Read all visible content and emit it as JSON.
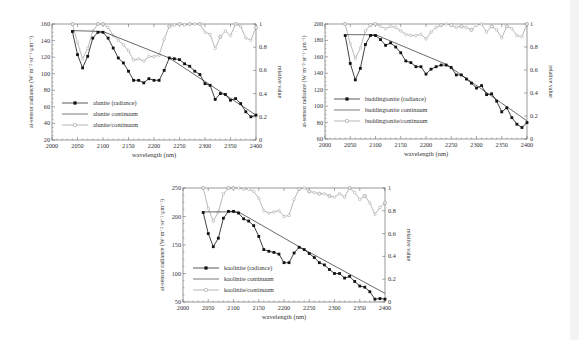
{
  "chart_data": [
    {
      "id": "alunite",
      "type": "line",
      "xlabel": "wavelength (nm)",
      "ylabel": "at-sensor radiance (W·m⁻²·sr⁻¹·μm⁻¹)",
      "ylabel_right": "relative value",
      "xlim": [
        2000,
        2400
      ],
      "ylim": [
        20,
        160
      ],
      "ylim_right": [
        0,
        1
      ],
      "xticks": [
        2000,
        2050,
        2100,
        2150,
        2200,
        2250,
        2300,
        2350,
        2400
      ],
      "yticks": [
        20,
        40,
        60,
        80,
        100,
        120,
        140,
        160
      ],
      "yticks_right": [
        0,
        0.2,
        0.4,
        0.6,
        0.8,
        1
      ],
      "grid": false,
      "legend_position": "lower-left",
      "frame": {
        "x0": 52,
        "x1": 256,
        "y0": 24,
        "y1": 140
      },
      "legend": {
        "x": 62,
        "y": 103,
        "dy": 11
      },
      "x": [
        2040,
        2050,
        2060,
        2070,
        2080,
        2090,
        2100,
        2110,
        2120,
        2130,
        2140,
        2150,
        2160,
        2170,
        2180,
        2190,
        2200,
        2210,
        2220,
        2230,
        2240,
        2250,
        2260,
        2270,
        2280,
        2290,
        2300,
        2310,
        2320,
        2330,
        2340,
        2350,
        2360,
        2370,
        2380,
        2390,
        2400
      ],
      "series": [
        {
          "name": "alunite (radiance)",
          "axis": "left",
          "style": "filled-square",
          "values": [
            151,
            123,
            107,
            121,
            143,
            150,
            150,
            143,
            131,
            119,
            113,
            103,
            92,
            92,
            89,
            94,
            92,
            92,
            104,
            119,
            118,
            117,
            112,
            109,
            103,
            99,
            88,
            86,
            69,
            76,
            75,
            68,
            70,
            64,
            54,
            48,
            50
          ]
        },
        {
          "name": "alunite continuum",
          "axis": "left",
          "style": "line",
          "points": [
            [
              2040,
              152
            ],
            [
              2100,
              151
            ],
            [
              2230,
              119
            ],
            [
              2400,
              50
            ]
          ]
        },
        {
          "name": "alunite/continuum",
          "axis": "right",
          "style": "open-circle",
          "values": [
            1.0,
            0.84,
            0.7,
            0.79,
            0.94,
            1.0,
            1.0,
            0.97,
            0.9,
            0.86,
            0.82,
            0.77,
            0.69,
            0.7,
            0.68,
            0.72,
            0.72,
            0.73,
            0.87,
            0.98,
            0.99,
            1.0,
            0.99,
            1.0,
            1.0,
            1.0,
            0.93,
            0.91,
            0.79,
            0.89,
            0.94,
            0.9,
            1.0,
            0.98,
            0.88,
            0.86,
            0.97
          ]
        }
      ]
    },
    {
      "id": "buddingtonite",
      "type": "line",
      "xlabel": "wavelength (nm)",
      "ylabel": "at-sensor radiance (W·m⁻²·sr⁻¹·μm⁻¹)",
      "ylabel_right": "relative value",
      "xlim": [
        2000,
        2400
      ],
      "ylim": [
        60,
        200
      ],
      "ylim_right": [
        0,
        1
      ],
      "xticks": [
        2000,
        2050,
        2100,
        2150,
        2200,
        2250,
        2300,
        2350,
        2400
      ],
      "yticks": [
        60,
        80,
        100,
        120,
        140,
        160,
        180,
        200
      ],
      "yticks_right": [
        0,
        0.2,
        0.4,
        0.6,
        0.8,
        1
      ],
      "grid": false,
      "legend_position": "lower-left",
      "frame": {
        "x0": 325,
        "x1": 527,
        "y0": 24,
        "y1": 139
      },
      "legend": {
        "x": 334,
        "y": 99,
        "dy": 11
      },
      "x": [
        2040,
        2050,
        2060,
        2070,
        2080,
        2090,
        2100,
        2110,
        2120,
        2130,
        2140,
        2150,
        2160,
        2170,
        2180,
        2190,
        2200,
        2210,
        2220,
        2230,
        2240,
        2250,
        2260,
        2270,
        2280,
        2290,
        2300,
        2310,
        2320,
        2330,
        2340,
        2350,
        2360,
        2370,
        2380,
        2390,
        2400
      ],
      "series": [
        {
          "name": "buddingtonite (radiance)",
          "axis": "left",
          "style": "filled-square",
          "values": [
            186,
            152,
            132,
            146,
            175,
            186,
            186,
            181,
            174,
            177,
            172,
            165,
            155,
            153,
            148,
            148,
            139,
            145,
            148,
            150,
            150,
            147,
            138,
            138,
            133,
            128,
            122,
            125,
            114,
            115,
            106,
            93,
            98,
            86,
            78,
            74,
            80
          ]
        },
        {
          "name": "buddingtonite continuum",
          "axis": "left",
          "style": "line",
          "points": [
            [
              2040,
              187
            ],
            [
              2100,
              187
            ],
            [
              2240,
              151
            ],
            [
              2400,
              82
            ]
          ]
        },
        {
          "name": "buddingtonite/continuum",
          "axis": "right",
          "style": "open-circle",
          "values": [
            1.0,
            0.83,
            0.7,
            0.79,
            0.94,
            0.99,
            1.0,
            0.98,
            0.96,
            0.98,
            0.97,
            0.94,
            0.91,
            0.9,
            0.9,
            0.91,
            0.87,
            0.93,
            0.97,
            0.99,
            1.0,
            0.99,
            0.97,
            0.98,
            0.97,
            0.95,
            0.99,
            1.0,
            0.93,
            0.98,
            0.95,
            0.88,
            0.98,
            0.96,
            0.9,
            0.89,
            1.0
          ]
        }
      ]
    },
    {
      "id": "kaolinite",
      "type": "line",
      "xlabel": "wavelength (nm)",
      "ylabel": "at-sensor radiance (W·m⁻²·sr⁻¹·μm⁻¹)",
      "ylabel_right": "relative value",
      "xlim": [
        2000,
        2400
      ],
      "ylim": [
        50,
        250
      ],
      "ylim_right": [
        0,
        1
      ],
      "xticks": [
        2000,
        2050,
        2100,
        2150,
        2200,
        2250,
        2300,
        2350,
        2400
      ],
      "yticks": [
        50,
        100,
        150,
        200,
        250
      ],
      "yticks_right": [
        0,
        0.2,
        0.4,
        0.6,
        0.8,
        1
      ],
      "grid": false,
      "legend_position": "lower-left",
      "frame": {
        "x0": 183,
        "x1": 385,
        "y0": 188,
        "y1": 302
      },
      "legend": {
        "x": 193,
        "y": 268,
        "dy": 11
      },
      "x": [
        2040,
        2050,
        2060,
        2070,
        2080,
        2090,
        2100,
        2110,
        2120,
        2130,
        2140,
        2150,
        2160,
        2170,
        2180,
        2190,
        2200,
        2210,
        2220,
        2230,
        2240,
        2250,
        2260,
        2270,
        2280,
        2290,
        2300,
        2310,
        2320,
        2330,
        2340,
        2350,
        2360,
        2370,
        2380,
        2390,
        2400
      ],
      "series": [
        {
          "name": "kaolinite (radiance)",
          "axis": "left",
          "style": "filled-square",
          "values": [
            207,
            170,
            147,
            162,
            197,
            209,
            209,
            206,
            196,
            192,
            184,
            165,
            142,
            139,
            137,
            134,
            119,
            119,
            136,
            146,
            142,
            135,
            128,
            119,
            115,
            107,
            100,
            100,
            92,
            95,
            86,
            78,
            76,
            68,
            55,
            56,
            55
          ]
        },
        {
          "name": "kaolinite continuum",
          "axis": "left",
          "style": "line",
          "points": [
            [
              2040,
              208
            ],
            [
              2110,
              208
            ],
            [
              2230,
              147
            ],
            [
              2400,
              65
            ]
          ]
        },
        {
          "name": "kaolinite/continuum",
          "axis": "right",
          "style": "open-circle",
          "values": [
            1.0,
            0.82,
            0.71,
            0.79,
            0.95,
            1.0,
            1.0,
            1.0,
            0.99,
            0.99,
            0.97,
            0.91,
            0.8,
            0.78,
            0.79,
            0.8,
            0.75,
            0.76,
            0.9,
            0.99,
            1.0,
            0.97,
            0.96,
            0.95,
            0.95,
            0.93,
            0.92,
            0.95,
            0.92,
            1.0,
            0.96,
            0.9,
            0.93,
            0.87,
            0.77,
            0.83,
            0.87
          ]
        }
      ]
    }
  ],
  "colors": {
    "radiance": "#111111",
    "continuum": "#444444",
    "ratio": "#9a9a9a",
    "axis": "#555555",
    "background": "#ffffff"
  }
}
